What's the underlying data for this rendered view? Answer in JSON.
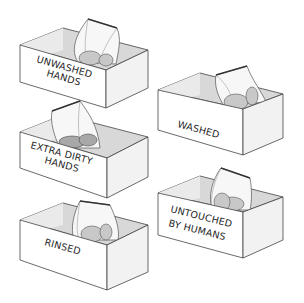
{
  "illustration": {
    "description": "Five open cardboard boxes, each containing a sealed plastic bag with items, labeled by handling condition",
    "boxes": [
      {
        "id": "unwashed",
        "label_lines": [
          "UNWASHED",
          "HANDS"
        ]
      },
      {
        "id": "washed",
        "label_lines": [
          "WASHED"
        ]
      },
      {
        "id": "extra-dirty",
        "label_lines": [
          "EXTRA DIRTY",
          "HANDS"
        ]
      },
      {
        "id": "untouched",
        "label_lines": [
          "UNTOUCHED",
          "BY HUMANS"
        ]
      },
      {
        "id": "rinsed",
        "label_lines": [
          "RINSED"
        ]
      }
    ],
    "colors": {
      "background": "#ffffff",
      "outline": "#444444",
      "text": "#1e1e1e",
      "inner_shadow": "#d8d8d8"
    }
  }
}
